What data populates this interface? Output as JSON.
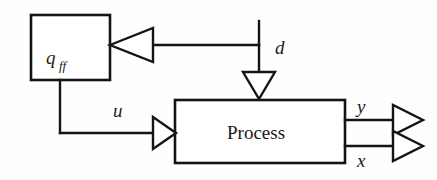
{
  "figure": {
    "background_color": "#fefefe",
    "line_color": "#141414",
    "fill_color": "#ffffff"
  },
  "blocks": [
    {
      "id": "feedforward",
      "label": "q",
      "subscript": "ff",
      "shape": "rectangle"
    },
    {
      "id": "process",
      "label": "Process",
      "shape": "rectangle"
    }
  ],
  "signals": {
    "disturbance": "d",
    "control": "u",
    "output_y": "y",
    "output_x": "x"
  },
  "icons": {
    "arrow_left": "arrowhead-left-icon",
    "arrow_right": "arrowhead-right-icon",
    "arrow_down": "arrowhead-down-icon",
    "junction": "junction-node-icon"
  }
}
